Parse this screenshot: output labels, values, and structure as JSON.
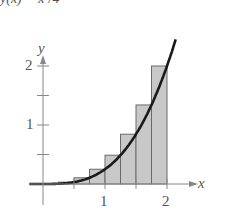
{
  "chart_data": {
    "type": "bar",
    "function": "y = x^3 / 4",
    "xlabel": "x",
    "ylabel": "y",
    "x_ticks": [
      0.5,
      1,
      1.5,
      2
    ],
    "x_tick_labels": [
      "1",
      "2"
    ],
    "y_ticks": [
      0.5,
      1,
      1.5,
      2
    ],
    "y_tick_labels": [
      "1",
      "2"
    ],
    "xlim": [
      -0.25,
      2.4
    ],
    "ylim": [
      -0.3,
      2.35
    ],
    "grid": false,
    "rectangles": {
      "method": "right endpoints (upper sum)",
      "width": 0.25,
      "x_left": [
        0,
        0.25,
        0.5,
        0.75,
        1,
        1.25,
        1.5,
        1.75
      ],
      "heights": [
        0.0039,
        0.0313,
        0.1055,
        0.25,
        0.4883,
        0.8438,
        1.3398,
        2.0
      ]
    }
  },
  "labels": {
    "top_cropped": "y(x) = x³/4",
    "y_axis": "y",
    "x_axis": "x",
    "tick_1": "1",
    "tick_2": "2",
    "ytick_1": "1",
    "ytick_2": "2"
  },
  "colors": {
    "rect_fill": "#c8c8c8",
    "rect_fill_light": "#e2e2e2",
    "rect_stroke": "#6a6a6a",
    "curve": "#1a1a1a",
    "axis": "#888888"
  }
}
